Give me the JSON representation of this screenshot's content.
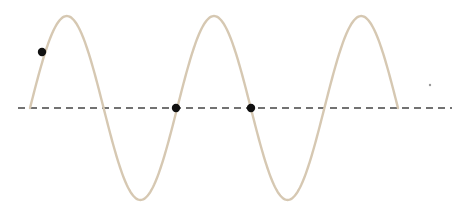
{
  "diagram": {
    "type": "sine-wave",
    "wave_color": "#d6c8b2",
    "axis_color": "#444444",
    "dot_color": "#111111",
    "cycles": 2.5,
    "start_x": 30,
    "end_x": 398,
    "axis_y": 108,
    "amplitude": 92,
    "axis": {
      "x1": 18,
      "x2": 452,
      "style": "dashed"
    },
    "points": [
      {
        "x": 42,
        "y": 52
      },
      {
        "x": 176,
        "y": 108
      },
      {
        "x": 251,
        "y": 108
      }
    ],
    "stray_mark": {
      "x": 430,
      "y": 85
    }
  }
}
